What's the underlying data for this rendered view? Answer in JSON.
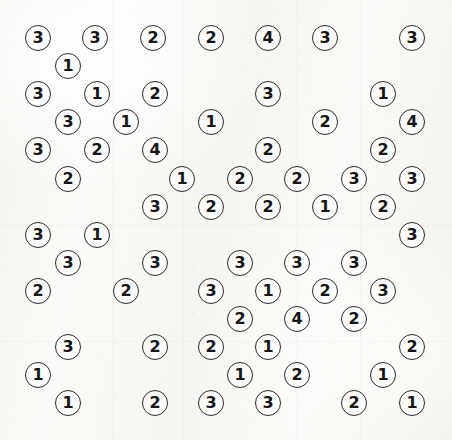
{
  "puzzle": {
    "title": "Circled Number Grid",
    "type": "numbered-circle-lattice",
    "background_color": "#f7f6f3",
    "circle_stroke_color": "#2b2b2b",
    "digit_color": "#151515",
    "circle_diameter": 26,
    "grid": {
      "columns": 8,
      "rows": 14,
      "column_step": 57.5,
      "row_step": 28.2,
      "row_offset_odd": 0,
      "row_offset_even": 29
    },
    "value_counts": {
      "1": 19,
      "2": 26,
      "3": 26,
      "4": 4
    },
    "total_circles": 75,
    "distinct_values": [
      "1",
      "2",
      "3",
      "4"
    ],
    "rows": [
      {
        "index": 1,
        "y": 38,
        "cells": [
          {
            "x": 38,
            "value": "3"
          },
          {
            "x": 95,
            "value": "3"
          },
          {
            "x": 153,
            "value": "2"
          },
          {
            "x": 211,
            "value": "2"
          },
          {
            "x": 268,
            "value": "4"
          },
          {
            "x": 325,
            "value": "3"
          },
          {
            "x": 412,
            "value": "3"
          }
        ]
      },
      {
        "index": 2,
        "y": 66,
        "cells": [
          {
            "x": 68,
            "value": "1"
          }
        ]
      },
      {
        "index": 3,
        "y": 94,
        "cells": [
          {
            "x": 38,
            "value": "3"
          },
          {
            "x": 97,
            "value": "1"
          },
          {
            "x": 155,
            "value": "2"
          },
          {
            "x": 268,
            "value": "3"
          },
          {
            "x": 383,
            "value": "1"
          }
        ]
      },
      {
        "index": 4,
        "y": 122,
        "cells": [
          {
            "x": 68,
            "value": "3"
          },
          {
            "x": 126,
            "value": "1"
          },
          {
            "x": 211,
            "value": "1"
          },
          {
            "x": 325,
            "value": "2"
          },
          {
            "x": 412,
            "value": "4"
          }
        ]
      },
      {
        "index": 5,
        "y": 150,
        "cells": [
          {
            "x": 38,
            "value": "3"
          },
          {
            "x": 97,
            "value": "2"
          },
          {
            "x": 155,
            "value": "4"
          },
          {
            "x": 268,
            "value": "2"
          },
          {
            "x": 383,
            "value": "2"
          }
        ]
      },
      {
        "index": 6,
        "y": 179,
        "cells": [
          {
            "x": 68,
            "value": "2"
          },
          {
            "x": 182,
            "value": "1"
          },
          {
            "x": 240,
            "value": "2"
          },
          {
            "x": 297,
            "value": "2"
          },
          {
            "x": 354,
            "value": "3"
          },
          {
            "x": 412,
            "value": "3"
          }
        ]
      },
      {
        "index": 7,
        "y": 207,
        "cells": [
          {
            "x": 155,
            "value": "3"
          },
          {
            "x": 211,
            "value": "2"
          },
          {
            "x": 268,
            "value": "2"
          },
          {
            "x": 325,
            "value": "1"
          },
          {
            "x": 383,
            "value": "2"
          }
        ]
      },
      {
        "index": 8,
        "y": 235,
        "cells": [
          {
            "x": 38,
            "value": "3"
          },
          {
            "x": 97,
            "value": "1"
          },
          {
            "x": 412,
            "value": "3"
          }
        ]
      },
      {
        "index": 9,
        "y": 263,
        "cells": [
          {
            "x": 68,
            "value": "3"
          },
          {
            "x": 155,
            "value": "3"
          },
          {
            "x": 240,
            "value": "3"
          },
          {
            "x": 297,
            "value": "3"
          },
          {
            "x": 354,
            "value": "3"
          }
        ]
      },
      {
        "index": 10,
        "y": 291,
        "cells": [
          {
            "x": 38,
            "value": "2"
          },
          {
            "x": 126,
            "value": "2"
          },
          {
            "x": 211,
            "value": "3"
          },
          {
            "x": 268,
            "value": "1"
          },
          {
            "x": 325,
            "value": "2"
          },
          {
            "x": 383,
            "value": "3"
          }
        ]
      },
      {
        "index": 11,
        "y": 319,
        "cells": [
          {
            "x": 240,
            "value": "2"
          },
          {
            "x": 297,
            "value": "4"
          },
          {
            "x": 354,
            "value": "2"
          }
        ]
      },
      {
        "index": 12,
        "y": 347,
        "cells": [
          {
            "x": 68,
            "value": "3"
          },
          {
            "x": 155,
            "value": "2"
          },
          {
            "x": 211,
            "value": "2"
          },
          {
            "x": 268,
            "value": "1"
          },
          {
            "x": 412,
            "value": "2"
          }
        ]
      },
      {
        "index": 13,
        "y": 375,
        "cells": [
          {
            "x": 38,
            "value": "1"
          },
          {
            "x": 240,
            "value": "1"
          },
          {
            "x": 297,
            "value": "2"
          },
          {
            "x": 383,
            "value": "1"
          }
        ]
      },
      {
        "index": 14,
        "y": 403,
        "cells": [
          {
            "x": 68,
            "value": "1"
          },
          {
            "x": 155,
            "value": "2"
          },
          {
            "x": 211,
            "value": "3"
          },
          {
            "x": 268,
            "value": "3"
          },
          {
            "x": 354,
            "value": "2"
          },
          {
            "x": 412,
            "value": "1"
          }
        ]
      }
    ]
  }
}
